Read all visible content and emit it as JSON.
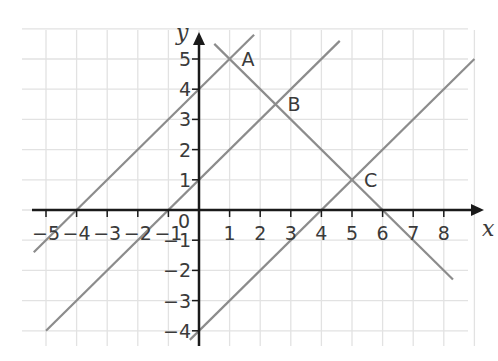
{
  "chart_data": {
    "type": "line",
    "title": "",
    "xlabel": "x",
    "ylabel": "y",
    "xlim": [
      -5.5,
      9
    ],
    "ylim": [
      -4.5,
      6
    ],
    "grid": true,
    "x_ticks": [
      -5,
      -4,
      -3,
      -2,
      -1,
      0,
      1,
      2,
      3,
      4,
      5,
      6,
      7,
      8
    ],
    "x_tick_labels": [
      "−5",
      "−4",
      "−3",
      "−2",
      "−1",
      "0",
      "1",
      "2",
      "3",
      "4",
      "5",
      "6",
      "7",
      "8"
    ],
    "y_ticks": [
      -4,
      -3,
      -2,
      -1,
      1,
      2,
      3,
      4,
      5
    ],
    "y_tick_labels": [
      "−4",
      "−3",
      "−2",
      "−1",
      "1",
      "2",
      "3",
      "4",
      "5"
    ],
    "origin_label": "0",
    "series": [
      {
        "name": "y = x + 4",
        "slope": 1,
        "intercept": 4,
        "x_range": [
          -5.4,
          1.8
        ]
      },
      {
        "name": "y = x + 1",
        "slope": 1,
        "intercept": 1,
        "x_range": [
          -5.0,
          4.6
        ]
      },
      {
        "name": "y = x − 4",
        "slope": 1,
        "intercept": -4,
        "x_range": [
          -0.3,
          9.0
        ]
      },
      {
        "name": "y = −x + 6",
        "slope": -1,
        "intercept": 6,
        "x_range": [
          0.5,
          8.3
        ]
      }
    ],
    "annotations": [
      {
        "label": "A",
        "x": 1,
        "y": 5
      },
      {
        "label": "B",
        "x": 2.5,
        "y": 3.5
      },
      {
        "label": "C",
        "x": 5,
        "y": 1
      }
    ]
  },
  "style": {
    "grid_color": "#e2e2e2",
    "axis_color": "#1a1a1a",
    "line_color": "#8c8c8c",
    "text_color": "#3a3a3a"
  }
}
